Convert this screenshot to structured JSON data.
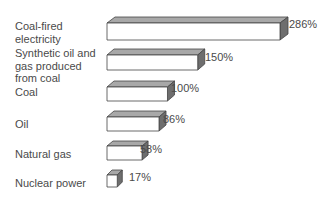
{
  "chart_data": {
    "type": "bar",
    "orientation": "horizontal",
    "style": "3d-block",
    "title": "",
    "xlabel": "",
    "ylabel": "",
    "categories": [
      "Coal-fired electricity",
      "Synthetic oil and gas produced from coal",
      "Coal",
      "Oil",
      "Natural gas",
      "Nuclear power"
    ],
    "values": [
      286,
      150,
      100,
      86,
      58,
      17
    ],
    "value_labels": [
      "286%",
      "150%",
      "100%",
      "86%",
      "58%",
      "17%"
    ],
    "unit": "%",
    "grid": false,
    "legend": null
  },
  "labels": [
    [
      "Coal-fired",
      "electricity"
    ],
    [
      "Synthetic oil and",
      "gas produced",
      "from coal"
    ],
    [
      "Coal"
    ],
    [
      "Oil"
    ],
    [
      "Natural gas"
    ],
    [
      "Nuclear power"
    ]
  ],
  "colors": {
    "front": "#ffffff",
    "top": "#a8a8a8",
    "side": "#6e6e6e",
    "edge": "#444444"
  }
}
